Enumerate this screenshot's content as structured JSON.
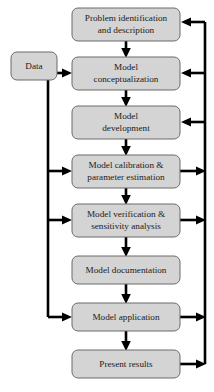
{
  "diagram": {
    "type": "flowchart",
    "colors": {
      "node_fill": "#d4d4d4",
      "node_stroke": "#6b6b6b",
      "connector": "#000000",
      "background": "#ffffff",
      "text": "#1a1a1a"
    },
    "nodes": [
      {
        "id": "data",
        "label_lines": [
          "Data"
        ],
        "line1": "Data",
        "line2": "",
        "x": 11,
        "y": 52,
        "w": 46,
        "h": 28
      },
      {
        "id": "problem-identification",
        "label_lines": [
          "Problem identification",
          "and description"
        ],
        "line1": "Problem identification",
        "line2": "and description",
        "x": 72,
        "y": 8,
        "w": 108,
        "h": 33
      },
      {
        "id": "model-conceptualization",
        "label_lines": [
          "Model",
          "conceptualization"
        ],
        "line1": "Model",
        "line2": "conceptualization",
        "x": 72,
        "y": 57,
        "w": 108,
        "h": 33
      },
      {
        "id": "model-development",
        "label_lines": [
          "Model",
          "development"
        ],
        "line1": "Model",
        "line2": "development",
        "x": 72,
        "y": 106,
        "w": 108,
        "h": 33
      },
      {
        "id": "model-calibration",
        "label_lines": [
          "Model calibration &",
          "parameter estimation"
        ],
        "line1": "Model calibration &",
        "line2": "parameter estimation",
        "x": 72,
        "y": 155,
        "w": 108,
        "h": 33
      },
      {
        "id": "model-verification",
        "label_lines": [
          "Model verification &",
          "sensitivity analysis"
        ],
        "line1": "Model verification &",
        "line2": "sensitivity analysis",
        "x": 72,
        "y": 204,
        "w": 108,
        "h": 33
      },
      {
        "id": "model-documentation",
        "label_lines": [
          "Model documentation"
        ],
        "line1": "Model documentation",
        "line2": "",
        "x": 72,
        "y": 256,
        "w": 108,
        "h": 28
      },
      {
        "id": "model-application",
        "label_lines": [
          "Model application"
        ],
        "line1": "Model application",
        "line2": "",
        "x": 72,
        "y": 303,
        "w": 108,
        "h": 28
      },
      {
        "id": "present-results",
        "label_lines": [
          "Present results"
        ],
        "line1": "Present results",
        "line2": "",
        "x": 72,
        "y": 350,
        "w": 108,
        "h": 28
      }
    ],
    "edges": [
      {
        "from": "problem-identification",
        "to": "model-conceptualization",
        "kind": "down"
      },
      {
        "from": "model-conceptualization",
        "to": "model-development",
        "kind": "down"
      },
      {
        "from": "model-development",
        "to": "model-calibration",
        "kind": "down"
      },
      {
        "from": "model-calibration",
        "to": "model-verification",
        "kind": "down"
      },
      {
        "from": "model-verification",
        "to": "model-documentation",
        "kind": "down"
      },
      {
        "from": "model-documentation",
        "to": "model-application",
        "kind": "down"
      },
      {
        "from": "model-application",
        "to": "present-results",
        "kind": "down"
      },
      {
        "from": "data",
        "to": "model-conceptualization",
        "kind": "right"
      },
      {
        "from": "data",
        "to": "model-calibration",
        "kind": "left-bus"
      },
      {
        "from": "data",
        "to": "model-verification",
        "kind": "left-bus"
      },
      {
        "from": "data",
        "to": "model-application",
        "kind": "left-bus"
      },
      {
        "from": "model-calibration",
        "to": "right-bus",
        "kind": "out-right"
      },
      {
        "from": "model-verification",
        "to": "right-bus",
        "kind": "out-right"
      },
      {
        "from": "model-application",
        "to": "right-bus",
        "kind": "out-right"
      },
      {
        "from": "present-results",
        "to": "right-bus",
        "kind": "out-right"
      },
      {
        "from": "right-bus",
        "to": "problem-identification",
        "kind": "in-left"
      },
      {
        "from": "right-bus",
        "to": "model-conceptualization",
        "kind": "in-left"
      },
      {
        "from": "right-bus",
        "to": "model-development",
        "kind": "in-left"
      }
    ]
  }
}
